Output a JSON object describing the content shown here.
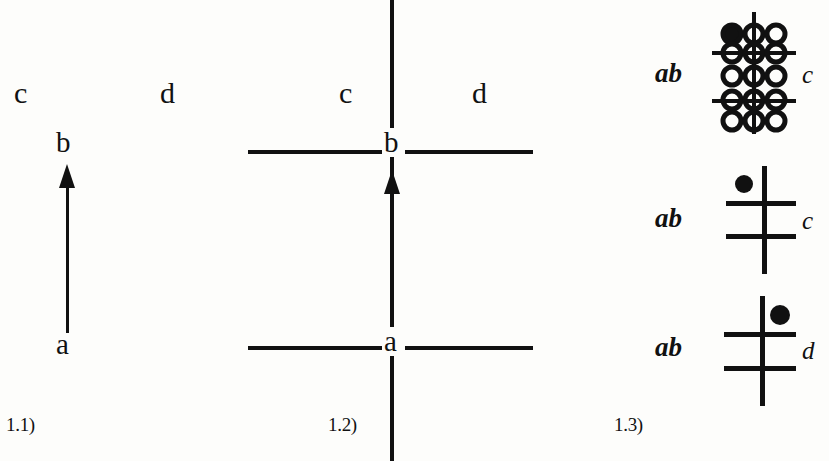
{
  "figure": {
    "width": 829,
    "height": 461,
    "background": "#fdfdfb",
    "ink": "#111111"
  },
  "panels": [
    {
      "id": "1.1",
      "caption": "1.1)",
      "region_labels": [
        {
          "text": "c",
          "style": "roman"
        },
        {
          "text": "d",
          "style": "roman"
        }
      ],
      "nodes": [
        {
          "text": "b",
          "position": "top"
        },
        {
          "text": "a",
          "position": "bottom"
        }
      ],
      "arrow": {
        "direction": "up",
        "from": "a",
        "to": "b"
      },
      "separators": []
    },
    {
      "id": "1.2",
      "caption": "1.2)",
      "region_labels": [
        {
          "text": "c",
          "style": "roman"
        },
        {
          "text": "d",
          "style": "roman"
        }
      ],
      "nodes": [
        {
          "text": "b",
          "position": "top"
        },
        {
          "text": "a",
          "position": "bottom"
        }
      ],
      "arrow": {
        "direction": "up",
        "from": "a",
        "to": "b"
      },
      "separators": [
        {
          "orientation": "vertical",
          "note": "full-height divider through a and b"
        },
        {
          "orientation": "horizontal",
          "note": "line through b"
        },
        {
          "orientation": "horizontal",
          "note": "line through a"
        }
      ]
    },
    {
      "id": "1.3",
      "caption": "1.3)",
      "rows": [
        {
          "left_label": "ab",
          "right_label": "c",
          "glyph": "ring-lattice",
          "lattice": {
            "rows": 5,
            "columns": 3,
            "filled_cell": {
              "row": 1,
              "column": 1
            },
            "stub_rows": [
              2,
              4
            ]
          }
        },
        {
          "left_label": "ab",
          "right_label": "c",
          "glyph": "cross",
          "dot_quadrant": "upper-left"
        },
        {
          "left_label": "ab",
          "right_label": "d",
          "glyph": "cross",
          "dot_quadrant": "upper-right"
        }
      ]
    }
  ]
}
